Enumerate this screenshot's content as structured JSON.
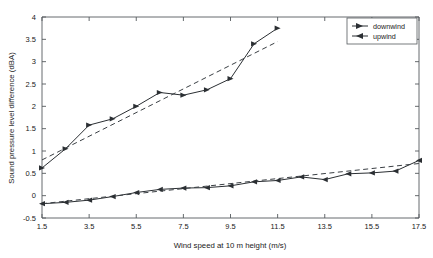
{
  "chart_data": {
    "type": "line",
    "title": "",
    "xlabel": "Wind speed at 10 m height (m/s)",
    "ylabel": "Sound pressure level difference (dBA)",
    "xlim": [
      1.5,
      17.5
    ],
    "ylim": [
      -0.5,
      4
    ],
    "xticks": [
      1.5,
      3.5,
      5.5,
      7.5,
      9.5,
      11.5,
      13.5,
      15.5,
      17.5
    ],
    "xtick_labels": [
      "1.5",
      "3.5",
      "5.5",
      "7.5",
      "9.5",
      "11.5",
      "13.5",
      "15.5",
      "17.5"
    ],
    "yticks": [
      -0.5,
      0,
      0.5,
      1,
      1.5,
      2,
      2.5,
      3,
      3.5,
      4
    ],
    "ytick_labels": [
      "-0.5",
      "0",
      "0.5",
      "1",
      "1.5",
      "2",
      "2.5",
      "3",
      "3.5",
      "4"
    ],
    "grid": false,
    "legend_position": "top-right",
    "series": [
      {
        "name": "downwind",
        "marker": "right-triangle",
        "style": "solid",
        "x": [
          1.5,
          2.5,
          3.5,
          4.5,
          5.5,
          6.5,
          7.5,
          8.5,
          9.5,
          10.5,
          11.5
        ],
        "values": [
          0.62,
          1.05,
          1.58,
          1.72,
          2.0,
          2.31,
          2.25,
          2.37,
          2.62,
          3.4,
          3.75
        ]
      },
      {
        "name": "upwind",
        "marker": "left-triangle",
        "style": "solid",
        "x": [
          1.5,
          2.5,
          3.5,
          4.5,
          5.5,
          6.5,
          7.5,
          8.5,
          9.5,
          10.5,
          11.5,
          12.5,
          13.5,
          14.5,
          15.5,
          16.5,
          17.5
        ],
        "values": [
          -0.18,
          -0.15,
          -0.1,
          -0.02,
          0.07,
          0.14,
          0.17,
          0.18,
          0.22,
          0.31,
          0.34,
          0.42,
          0.36,
          0.49,
          0.51,
          0.55,
          0.79
        ]
      }
    ],
    "trends": [
      {
        "name": "downwind-trend",
        "style": "dashed",
        "x": [
          1.5,
          11.5
        ],
        "values": [
          0.8,
          3.45
        ]
      },
      {
        "name": "upwind-trend",
        "style": "dashed",
        "x": [
          1.5,
          17.5
        ],
        "values": [
          -0.18,
          0.72
        ]
      }
    ]
  },
  "legend": {
    "entries": [
      {
        "label": "downwind",
        "marker": "right-triangle"
      },
      {
        "label": "upwind",
        "marker": "left-triangle"
      }
    ]
  },
  "colors": {
    "line": "#2b2f33",
    "axis": "#555a5e",
    "background": "#ffffff"
  }
}
